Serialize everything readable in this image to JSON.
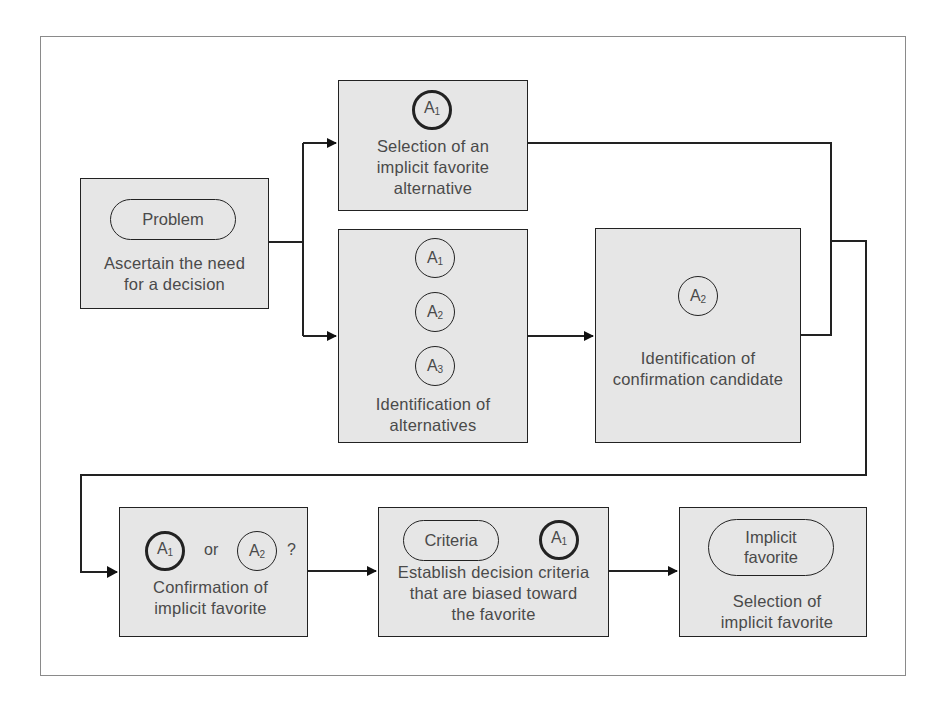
{
  "figure": {
    "problem_box": {
      "pill": "Problem",
      "lines": [
        "Ascertain the need",
        "for a decision"
      ]
    },
    "selection_box": {
      "circle": {
        "letter": "A",
        "sub": "1",
        "emphasis": true
      },
      "lines": [
        "Selection of an",
        "implicit favorite",
        "alternative"
      ]
    },
    "alternatives_box": {
      "circles": [
        {
          "letter": "A",
          "sub": "1"
        },
        {
          "letter": "A",
          "sub": "2"
        },
        {
          "letter": "A",
          "sub": "3"
        }
      ],
      "lines": [
        "Identification of",
        "alternatives"
      ]
    },
    "candidate_box": {
      "circle": {
        "letter": "A",
        "sub": "2"
      },
      "lines": [
        "Identification of",
        "confirmation candidate"
      ]
    },
    "confirmation_box": {
      "circle_a": {
        "letter": "A",
        "sub": "1",
        "emphasis": true
      },
      "connector": "or",
      "circle_b": {
        "letter": "A",
        "sub": "2"
      },
      "question": "?",
      "lines": [
        "Confirmation of",
        "implicit favorite"
      ]
    },
    "criteria_box": {
      "pill": "Criteria",
      "circle": {
        "letter": "A",
        "sub": "1",
        "emphasis": true
      },
      "lines": [
        "Establish decision criteria",
        "that are biased toward",
        "the favorite"
      ]
    },
    "final_box": {
      "pill_lines": [
        "Implicit",
        "favorite"
      ],
      "lines": [
        "Selection of",
        "implicit favorite"
      ]
    }
  },
  "colors": {
    "box_fill": "#e6e6e6",
    "line": "#222222",
    "text": "#4a4a4a",
    "frame": "#8a8a8a"
  }
}
